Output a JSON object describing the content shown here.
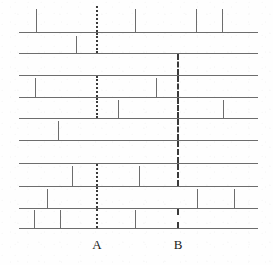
{
  "figure": {
    "width": 273,
    "height": 265,
    "background_color": "#fefefe",
    "line_color": "#6d6d6d",
    "marker_color": "#3a3a3a"
  },
  "chart_data": {
    "type": "bar",
    "title": "",
    "xlabel": "",
    "ylabel": "",
    "grid": false,
    "legend": "none",
    "xlim": [
      0,
      273
    ],
    "rows": [
      {
        "index": 1,
        "baseline_y": 32,
        "x_start": 19,
        "x_end": 258,
        "tick_height": 23,
        "ticks": [
          36,
          135,
          196,
          222
        ]
      },
      {
        "index": 2,
        "baseline_y": 53,
        "x_start": 19,
        "x_end": 258,
        "tick_height": 17,
        "ticks": [
          76
        ]
      },
      {
        "index": 3,
        "baseline_y": 75,
        "x_start": 19,
        "x_end": 258,
        "tick_height": 17,
        "ticks": []
      },
      {
        "index": 4,
        "baseline_y": 97,
        "x_start": 19,
        "x_end": 258,
        "tick_height": 19,
        "ticks": [
          35,
          156
        ]
      },
      {
        "index": 5,
        "baseline_y": 118,
        "x_start": 19,
        "x_end": 258,
        "tick_height": 18,
        "ticks": [
          118,
          223
        ]
      },
      {
        "index": 6,
        "baseline_y": 140,
        "x_start": 19,
        "x_end": 258,
        "tick_height": 19,
        "ticks": [
          58
        ]
      },
      {
        "index": 7,
        "baseline_y": 163,
        "x_start": 19,
        "x_end": 258,
        "tick_height": 17,
        "ticks": []
      },
      {
        "index": 8,
        "baseline_y": 186,
        "x_start": 19,
        "x_end": 258,
        "tick_height": 20,
        "ticks": [
          72,
          139
        ]
      },
      {
        "index": 9,
        "baseline_y": 208,
        "x_start": 19,
        "x_end": 258,
        "tick_height": 19,
        "ticks": [
          47,
          197,
          234
        ]
      },
      {
        "index": 10,
        "baseline_y": 228,
        "x_start": 19,
        "x_end": 258,
        "tick_height": 18,
        "ticks": [
          34,
          60,
          135
        ]
      }
    ],
    "markers": [
      {
        "id": "A",
        "label": "A",
        "x": 96,
        "style": "dotted",
        "label_y": 237,
        "segments": [
          {
            "y_top": 6,
            "y_bottom": 32
          },
          {
            "y_top": 33,
            "y_bottom": 53
          },
          {
            "y_top": 76,
            "y_bottom": 97
          },
          {
            "y_top": 98,
            "y_bottom": 118
          },
          {
            "y_top": 164,
            "y_bottom": 186
          },
          {
            "y_top": 187,
            "y_bottom": 208
          },
          {
            "y_top": 209,
            "y_bottom": 228
          }
        ]
      },
      {
        "id": "B",
        "label": "B",
        "x": 177,
        "style": "dashed",
        "label_y": 237,
        "segments": [
          {
            "y_top": 54,
            "y_bottom": 75
          },
          {
            "y_top": 76,
            "y_bottom": 97
          },
          {
            "y_top": 98,
            "y_bottom": 118
          },
          {
            "y_top": 119,
            "y_bottom": 140
          },
          {
            "y_top": 141,
            "y_bottom": 163
          },
          {
            "y_top": 164,
            "y_bottom": 186
          },
          {
            "y_top": 209,
            "y_bottom": 228
          }
        ]
      }
    ]
  }
}
